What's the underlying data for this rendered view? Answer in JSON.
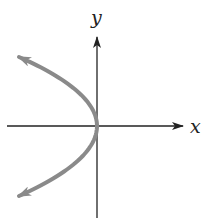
{
  "figure": {
    "axes": {
      "x_label": "x",
      "y_label": "y",
      "origin_px": [
        97,
        126
      ],
      "x_axis_px": {
        "from": 7,
        "to": 183
      },
      "y_axis_px": {
        "from": 218,
        "to": 37
      },
      "color": "#222222"
    },
    "curve": {
      "type": "parabola",
      "equation_form": "x = -a*y^2",
      "opens": "left",
      "vertex": [
        0,
        0
      ],
      "color": "#8a8a8a",
      "stroke_width": 4,
      "arrow_ends": [
        "upper-left",
        "lower-left"
      ],
      "endpoints_px": [
        [
          19,
          57
        ],
        [
          19,
          196
        ]
      ]
    }
  }
}
